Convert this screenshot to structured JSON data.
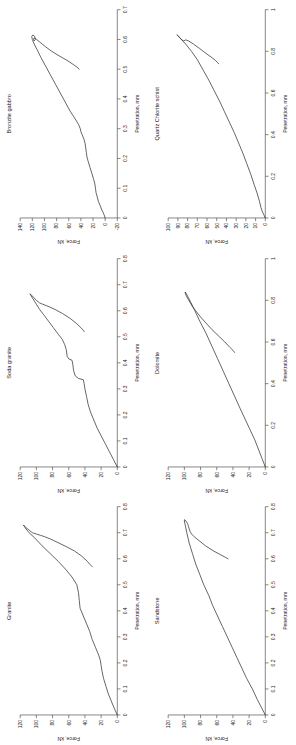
{
  "figure": {
    "type": "multi-panel-line-chart",
    "panel_count": 6,
    "orientation": "rotated-90-ccw",
    "axis_color": "#555555",
    "curve_color": "#333333",
    "background": "#ffffff"
  },
  "chart_data": [
    {
      "type": "line",
      "title": "Granite",
      "xlabel": "Penetration, mm",
      "ylabel": "Force, kN",
      "xlim": [
        0,
        0.8
      ],
      "ylim": [
        0,
        120
      ],
      "xticks": [
        "0",
        "0.1",
        "0.2",
        "0.3",
        "0.4",
        "0.5",
        "0.6",
        "0.7",
        "0.8"
      ],
      "yticks": [
        "0",
        "20",
        "40",
        "60",
        "80",
        "100",
        "120"
      ],
      "grid": false,
      "legend": "none",
      "series": [
        {
          "name": "loading-unloading loop",
          "x": [
            0,
            0.02,
            0.05,
            0.08,
            0.11,
            0.14,
            0.17,
            0.19,
            0.21,
            0.23,
            0.26,
            0.29,
            0.32,
            0.35,
            0.38,
            0.41,
            0.44,
            0.47,
            0.5,
            0.53,
            0.56,
            0.59,
            0.62,
            0.65,
            0.68,
            0.7,
            0.715,
            0.725,
            0.73,
            0.72,
            0.71,
            0.7,
            0.695,
            0.69,
            0.685,
            0.675,
            0.66,
            0.645,
            0.63,
            0.61,
            0.59,
            0.575,
            0.57
          ],
          "y": [
            0,
            3,
            7,
            11,
            14,
            17,
            19,
            20,
            21,
            23,
            27,
            31,
            34,
            38,
            42,
            46,
            47,
            48,
            50,
            56,
            64,
            73,
            83,
            93,
            102,
            109,
            113,
            115,
            116,
            113,
            109,
            105,
            100,
            95,
            90,
            82,
            72,
            62,
            53,
            44,
            37,
            33,
            31
          ]
        }
      ]
    },
    {
      "type": "line",
      "title": "Sandstone",
      "xlabel": "Penetration, mm",
      "ylabel": "Force, kN",
      "xlim": [
        0,
        0.8
      ],
      "ylim": [
        0,
        120
      ],
      "xticks": [
        "0",
        "0.1",
        "0.2",
        "0.3",
        "0.4",
        "0.5",
        "0.6",
        "0.7",
        "0.8"
      ],
      "yticks": [
        "0",
        "20",
        "40",
        "60",
        "80",
        "100",
        "120"
      ],
      "grid": false,
      "legend": "none",
      "series": [
        {
          "name": "loading-unloading loop",
          "x": [
            0,
            0.03,
            0.06,
            0.1,
            0.14,
            0.18,
            0.22,
            0.26,
            0.3,
            0.34,
            0.38,
            0.42,
            0.46,
            0.5,
            0.54,
            0.58,
            0.62,
            0.66,
            0.7,
            0.73,
            0.745,
            0.75,
            0.745,
            0.735,
            0.725,
            0.715,
            0.705,
            0.7,
            0.695,
            0.685,
            0.67,
            0.65,
            0.63,
            0.615,
            0.605,
            0.6
          ],
          "y": [
            0,
            5,
            10,
            16,
            23,
            29,
            35,
            41,
            47,
            53,
            59,
            65,
            70,
            76,
            81,
            86,
            90,
            94,
            97,
            99,
            100,
            100,
            98,
            96,
            95,
            94,
            93,
            92,
            91,
            88,
            82,
            74,
            64,
            55,
            49,
            46
          ]
        }
      ]
    },
    {
      "type": "line",
      "title": "Soda granite",
      "xlabel": "Penetration, mm",
      "ylabel": "Force, kN",
      "xlim": [
        0,
        0.8
      ],
      "ylim": [
        0,
        120
      ],
      "xticks": [
        "0",
        "0.1",
        "0.2",
        "0.3",
        "0.4",
        "0.5",
        "0.6",
        "0.7",
        "0.8"
      ],
      "yticks": [
        "0",
        "20",
        "40",
        "60",
        "80",
        "100",
        "120"
      ],
      "grid": false,
      "legend": "none",
      "series": [
        {
          "name": "loading-unloading loop",
          "x": [
            0,
            0.03,
            0.06,
            0.09,
            0.12,
            0.15,
            0.18,
            0.21,
            0.24,
            0.27,
            0.3,
            0.32,
            0.335,
            0.34,
            0.35,
            0.37,
            0.395,
            0.41,
            0.415,
            0.425,
            0.45,
            0.47,
            0.49,
            0.51,
            0.535,
            0.56,
            0.585,
            0.605,
            0.625,
            0.645,
            0.66,
            0.665,
            0.66,
            0.65,
            0.64,
            0.63,
            0.625,
            0.62,
            0.615,
            0.605,
            0.59,
            0.57,
            0.55,
            0.535,
            0.525,
            0.52
          ],
          "y": [
            0,
            5,
            10,
            15,
            20,
            25,
            29,
            33,
            36,
            38,
            40,
            41,
            42,
            48,
            52,
            54,
            55,
            56,
            60,
            62,
            63,
            65,
            68,
            73,
            79,
            85,
            91,
            96,
            100,
            104,
            107,
            108,
            106,
            103,
            100,
            96,
            92,
            88,
            84,
            77,
            68,
            58,
            50,
            45,
            42,
            41
          ]
        }
      ]
    },
    {
      "type": "line",
      "title": "Dolomite",
      "xlabel": "Penetration, mm",
      "ylabel": "Force, kN",
      "xlim": [
        0,
        1.0
      ],
      "ylim": [
        0,
        120
      ],
      "xticks": [
        "0",
        "0.2",
        "0.4",
        "0.6",
        "0.8",
        "1"
      ],
      "yticks": [
        "0",
        "20",
        "40",
        "60",
        "80",
        "100",
        "120"
      ],
      "grid": false,
      "legend": "none",
      "series": [
        {
          "name": "loading-unloading loop",
          "x": [
            0,
            0.04,
            0.08,
            0.13,
            0.18,
            0.23,
            0.28,
            0.34,
            0.4,
            0.46,
            0.52,
            0.58,
            0.64,
            0.7,
            0.75,
            0.79,
            0.82,
            0.835,
            0.84,
            0.835,
            0.825,
            0.81,
            0.79,
            0.77,
            0.75,
            0.72,
            0.69,
            0.66,
            0.63,
            0.6,
            0.575,
            0.56,
            0.55
          ],
          "y": [
            0,
            4,
            8,
            13,
            19,
            25,
            31,
            38,
            45,
            52,
            59,
            66,
            73,
            81,
            87,
            92,
            96,
            98,
            99,
            99,
            98,
            96,
            93,
            90,
            86,
            80,
            73,
            66,
            58,
            50,
            44,
            40,
            38
          ]
        }
      ]
    },
    {
      "type": "line",
      "title": "Bronzite gabbro",
      "xlabel": "Penetration, mm",
      "ylabel": "Force, kN",
      "xlim": [
        0,
        0.7
      ],
      "ylim": [
        -20,
        140
      ],
      "xticks": [
        "0",
        "0.1",
        "0.2",
        "0.3",
        "0.4",
        "0.5",
        "0.6",
        "0.7"
      ],
      "yticks": [
        "-20",
        "0",
        "20",
        "40",
        "60",
        "80",
        "100",
        "120",
        "140"
      ],
      "grid": false,
      "legend": "none",
      "series": [
        {
          "name": "loading-unloading loop",
          "x": [
            0,
            0.012,
            0.025,
            0.04,
            0.055,
            0.07,
            0.085,
            0.1,
            0.115,
            0.13,
            0.15,
            0.17,
            0.19,
            0.205,
            0.22,
            0.235,
            0.25,
            0.265,
            0.28,
            0.29,
            0.3,
            0.315,
            0.335,
            0.36,
            0.39,
            0.42,
            0.45,
            0.48,
            0.51,
            0.54,
            0.565,
            0.585,
            0.6,
            0.61,
            0.615,
            0.61,
            0.6,
            0.595,
            0.6,
            0.605,
            0.6,
            0.59,
            0.575,
            0.56,
            0.545,
            0.53,
            0.515,
            0.505,
            0.5
          ],
          "y": [
            0,
            2,
            5,
            8,
            11,
            13,
            15,
            16,
            17,
            19,
            22,
            25,
            28,
            30,
            31,
            32,
            33,
            35,
            38,
            40,
            41,
            44,
            50,
            58,
            66,
            74,
            82,
            90,
            98,
            106,
            112,
            117,
            120,
            121,
            119,
            116,
            115,
            117,
            118,
            117,
            113,
            107,
            98,
            88,
            76,
            63,
            52,
            45,
            43
          ]
        }
      ]
    },
    {
      "type": "line",
      "title": "Quartz Chlorite schist",
      "xlabel": "Penetration, mm",
      "ylabel": "Force, kN",
      "xlim": [
        0,
        1.0
      ],
      "ylim": [
        0,
        100
      ],
      "xticks": [
        "0",
        "0.2",
        "0.4",
        "0.6",
        "0.8",
        "1"
      ],
      "yticks": [
        "0",
        "10",
        "20",
        "30",
        "40",
        "50",
        "60",
        "70",
        "80",
        "90",
        "100"
      ],
      "grid": false,
      "legend": "none",
      "series": [
        {
          "name": "loading-unloading loop",
          "x": [
            0,
            0.015,
            0.03,
            0.05,
            0.08,
            0.12,
            0.16,
            0.21,
            0.26,
            0.31,
            0.36,
            0.41,
            0.46,
            0.51,
            0.56,
            0.61,
            0.66,
            0.71,
            0.76,
            0.8,
            0.835,
            0.86,
            0.875,
            0.88,
            0.875,
            0.865,
            0.855,
            0.85,
            0.855,
            0.85,
            0.835,
            0.815,
            0.79,
            0.77,
            0.755,
            0.745,
            0.74
          ],
          "y": [
            0,
            1.5,
            3,
            4.5,
            6,
            8.5,
            11.5,
            15,
            19,
            23,
            27.5,
            32,
            37,
            42,
            47,
            52.5,
            58,
            64,
            70,
            76,
            82,
            87,
            90,
            91,
            90,
            88,
            86,
            84,
            82,
            79,
            74,
            68,
            61,
            55,
            51,
            49,
            48
          ]
        }
      ]
    }
  ]
}
